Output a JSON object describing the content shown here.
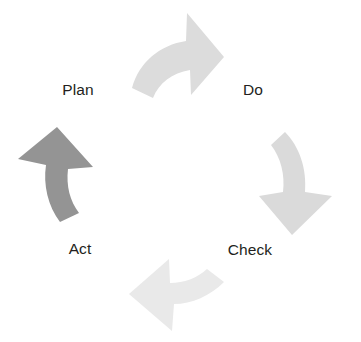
{
  "diagram": {
    "type": "cycle-diagram",
    "direction": "clockwise",
    "background_color": "#ffffff",
    "text_color": "#231f20",
    "stages": [
      {
        "id": "plan",
        "label": "Plan",
        "position": "top-left",
        "x": 78,
        "y": 90
      },
      {
        "id": "do",
        "label": "Do",
        "position": "top-right",
        "x": 253,
        "y": 90
      },
      {
        "id": "check",
        "label": "Check",
        "position": "bottom-right",
        "x": 250,
        "y": 250
      },
      {
        "id": "act",
        "label": "Act",
        "position": "bottom-left",
        "x": 80,
        "y": 249
      }
    ],
    "arrows": [
      {
        "id": "arrow-plan-to-do",
        "from": "plan",
        "to": "do",
        "position": "top",
        "points": "right-down",
        "color": "#dcdcdc"
      },
      {
        "id": "arrow-do-to-check",
        "from": "do",
        "to": "check",
        "position": "right",
        "points": "down",
        "color": "#dadada"
      },
      {
        "id": "arrow-check-to-act",
        "from": "check",
        "to": "act",
        "position": "bottom",
        "points": "left",
        "color": "#e9e9e9"
      },
      {
        "id": "arrow-act-to-plan",
        "from": "act",
        "to": "plan",
        "position": "left",
        "points": "up",
        "color": "#949494"
      }
    ]
  }
}
